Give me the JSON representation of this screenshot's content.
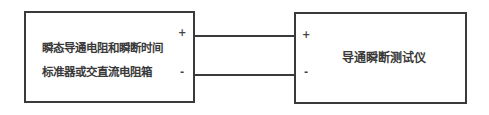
{
  "diagram": {
    "left_box": {
      "line1": "瞬态导通电阻和瞬断时间",
      "line2": "标准器或交直流电阻箱",
      "plus": "+",
      "minus": "-"
    },
    "right_box": {
      "label": "导通瞬断测试仪",
      "plus": "+",
      "minus": "-"
    },
    "connections": [
      {
        "from": "left_box.plus",
        "to": "right_box.plus"
      },
      {
        "from": "left_box.minus",
        "to": "right_box.minus"
      }
    ]
  }
}
